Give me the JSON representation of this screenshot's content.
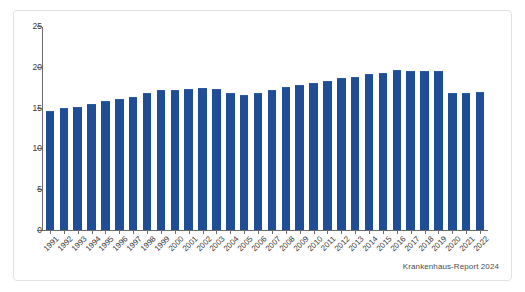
{
  "figure": {
    "source_note": "Krankenhaus-Report 2024",
    "bar_color": "#1f4e96",
    "axis_color": "#6b6b6b",
    "frame_color": "#e2e2e2",
    "background": "#ffffff"
  },
  "chart_data": {
    "type": "bar",
    "title": "",
    "subtitle": "",
    "xlabel": "",
    "ylabel": "",
    "ylim": [
      0,
      25
    ],
    "yticks": [
      0,
      5,
      10,
      15,
      20,
      25
    ],
    "ytick_labels": [
      "0",
      "5",
      "10",
      "15",
      "20",
      "25"
    ],
    "grid": false,
    "legend": null,
    "legend_position": "none",
    "annotations": [
      "Krankenhaus-Report 2024"
    ],
    "categories": [
      "1991",
      "1992",
      "1993",
      "1994",
      "1995",
      "1996",
      "1997",
      "1998",
      "1999",
      "2000",
      "2001",
      "2002",
      "2003",
      "2004",
      "2005",
      "2006",
      "2007",
      "2008",
      "2009",
      "2010",
      "2011",
      "2012",
      "2013",
      "2014",
      "2015",
      "2016",
      "2017",
      "2018",
      "2019",
      "2020",
      "2021",
      "2022"
    ],
    "values": [
      14.6,
      14.9,
      15.1,
      15.4,
      15.8,
      16.1,
      16.3,
      16.8,
      17.1,
      17.2,
      17.3,
      17.4,
      17.3,
      16.8,
      16.6,
      16.8,
      17.2,
      17.5,
      17.8,
      18.0,
      18.3,
      18.6,
      18.8,
      19.1,
      19.2,
      19.6,
      19.5,
      19.5,
      19.5,
      16.8,
      16.8,
      16.9
    ]
  }
}
